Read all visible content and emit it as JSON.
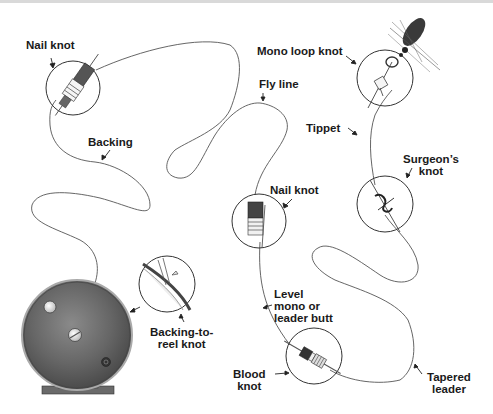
{
  "diagram": {
    "labels": {
      "nail_knot_top": "Nail knot",
      "backing": "Backing",
      "fly_line": "Fly line",
      "mono_loop_knot": "Mono loop knot",
      "tippet": "Tippet",
      "surgeons_knot_1": "Surgeon’s",
      "surgeons_knot_2": "knot",
      "nail_knot_mid": "Nail knot",
      "level_mono_1": "Level",
      "level_mono_2": "mono or",
      "level_mono_3": "leader butt",
      "backing_to_reel_1": "Backing-to-",
      "backing_to_reel_2": "reel knot",
      "blood_knot_1": "Blood",
      "blood_knot_2": "knot",
      "tapered_leader_1": "Tapered",
      "tapered_leader_2": "leader"
    },
    "sequence": [
      "Reel",
      "Backing-to-reel knot",
      "Backing",
      "Nail knot",
      "Fly line",
      "Nail knot",
      "Level mono or leader butt",
      "Blood knot",
      "Tapered leader",
      "Surgeon’s knot",
      "Tippet",
      "Mono loop knot",
      "Fly"
    ],
    "colors": {
      "line": "#555555",
      "text": "#1a1a1a",
      "reel": "#6b6b6b",
      "fly": "#3a3a3a"
    }
  }
}
